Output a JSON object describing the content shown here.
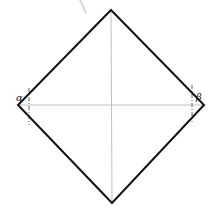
{
  "diagram": {
    "shape": "square rotated 45 degrees (rhombus) with diagonals",
    "vertices": {
      "top": [
        111,
        10
      ],
      "right": [
        204,
        105
      ],
      "bottom": [
        112,
        203
      ],
      "left": [
        18,
        105
      ]
    },
    "center": [
      111,
      106
    ],
    "labels": [
      {
        "text": "α",
        "x": 16,
        "y": 101
      },
      {
        "text": "β",
        "x": 196,
        "y": 100
      }
    ],
    "dashed_lines": [
      {
        "x": 29,
        "y1": 88,
        "y2": 125
      },
      {
        "x": 192,
        "y1": 85,
        "y2": 122
      }
    ],
    "colors": {
      "outline": "#111111",
      "diagonals": "#b0b0b0",
      "dashed": "#555555",
      "faint_mark": "#d8d8d8"
    }
  }
}
